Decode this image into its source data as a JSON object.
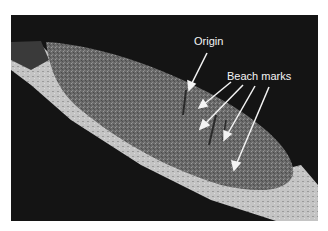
{
  "figure": {
    "labels": {
      "origin": "Origin",
      "beach_marks": "Beach marks"
    },
    "colors": {
      "background": "#141414",
      "fracture_surface": "#6e6e6e",
      "shear_lip": "#c8c8c8",
      "annotation": "#f4f4f4"
    }
  }
}
